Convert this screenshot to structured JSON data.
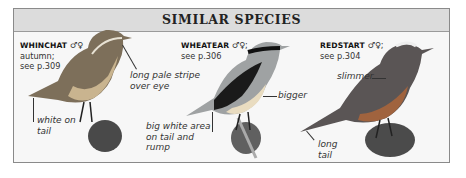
{
  "header": {
    "title": "SIMILAR SPECIES"
  },
  "species": [
    {
      "name": "WHINCHAT",
      "sex_symbols": "♂♀",
      "detail_lines": [
        "autumn;",
        "see p.309"
      ],
      "notes": [
        "long pale stripe over eye",
        "white on tail"
      ]
    },
    {
      "name": "WHEATEAR",
      "sex_symbols": "♂♀;",
      "detail_lines": [
        "see p.306"
      ],
      "notes": [
        "bigger",
        "big white area on tail and rump"
      ]
    },
    {
      "name": "REDSTART",
      "sex_symbols": "♂♀;",
      "detail_lines": [
        "see p.304"
      ],
      "notes": [
        "slimmer",
        "long tail"
      ]
    }
  ],
  "notes": {
    "whinchat_stripe_1": "long pale stripe",
    "whinchat_stripe_2": "over eye",
    "whinchat_tail_1": "white on",
    "whinchat_tail_2": "tail",
    "wheatear_bigger": "bigger",
    "wheatear_area_1": "big white area",
    "wheatear_area_2": "on tail and",
    "wheatear_area_3": "rump",
    "redstart_slimmer": "slimmer",
    "redstart_tail_1": "long",
    "redstart_tail_2": "tail"
  }
}
